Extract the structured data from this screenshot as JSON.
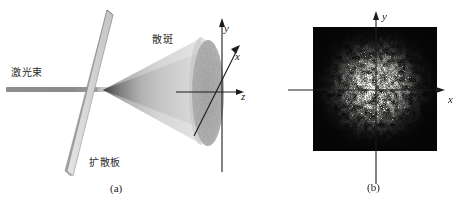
{
  "figure": {
    "type": "optics-schematic",
    "panels": [
      {
        "id": "a",
        "caption": "(a)",
        "labels": {
          "laser_beam": "激光束",
          "diffuser_plate": "扩散板",
          "speckle": "散斑"
        },
        "axes": {
          "y": "y",
          "x": "x",
          "z": "z"
        }
      },
      {
        "id": "b",
        "caption": "(b)",
        "axes": {
          "y": "y",
          "x": "x"
        }
      }
    ]
  },
  "colors": {
    "beam": "#8e8e8e",
    "plate_face": "#d2d2d2",
    "plate_edge": "#8d8d8d",
    "cone": "#b5b5b5",
    "ellipse": "#a9a9a9",
    "axis": "#1c1c1c",
    "photo_background": "#050505",
    "speckle_bright": "#d8d8cf",
    "text": "#1c1c1c"
  }
}
